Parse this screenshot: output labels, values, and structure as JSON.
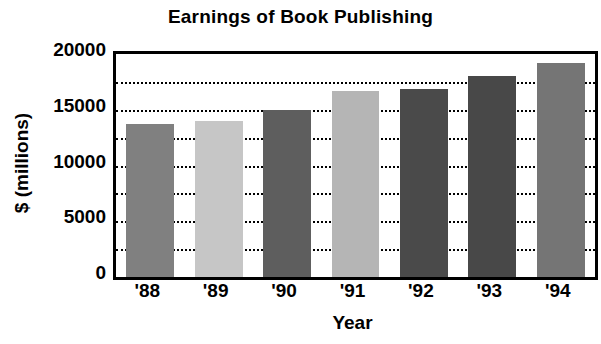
{
  "chart_data": {
    "type": "bar",
    "title": "Earnings of Book Publishing",
    "xlabel": "Year",
    "ylabel": "$ (millions)",
    "categories": [
      "'88",
      "'89",
      "'90",
      "'91",
      "'92",
      "'93",
      "'94"
    ],
    "values": [
      13750,
      14000,
      15000,
      16700,
      16900,
      18000,
      19200
    ],
    "ylim": [
      0,
      20000
    ],
    "ytick_labels": [
      "0",
      "5000",
      "10000",
      "15000",
      "20000"
    ],
    "ytick_values": [
      0,
      5000,
      10000,
      15000,
      20000
    ],
    "gridlines": {
      "visible": true,
      "style": "dotted",
      "values": [
        2500,
        5000,
        7500,
        10000,
        12500,
        15000,
        17500
      ]
    },
    "legend": {
      "visible": false
    },
    "bar_colors": [
      "#808080",
      "#c6c6c6",
      "#5e5e5e",
      "#b5b5b5",
      "#4a4a4a",
      "#484848",
      "#757575"
    ],
    "axis_color": "#000000"
  }
}
